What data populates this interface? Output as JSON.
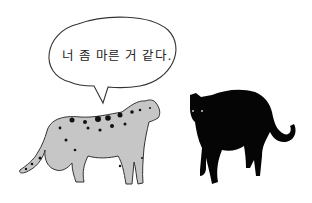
{
  "illustration": {
    "speech_bubble": {
      "text": "너 좀 마른 거 같다."
    },
    "characters": [
      {
        "name": "cheetah",
        "color": "#c8c8c8",
        "spots": "#111111"
      },
      {
        "name": "black-panther",
        "color": "#050505",
        "eyes": "#dddddd"
      }
    ],
    "background": "#ffffff"
  }
}
